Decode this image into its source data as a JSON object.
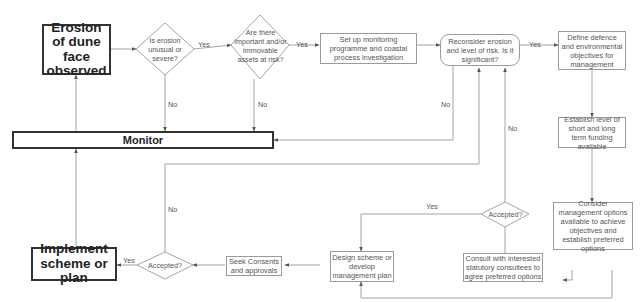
{
  "diagram": {
    "nodes": {
      "erosion_observed": "Erosion of dune face observed",
      "is_unusual": "Is erosion unusual or severe?",
      "assets_at_risk": "Are there important and/or immovable assets at risk?",
      "setup_monitoring": "Set up monitoring programme and coastal process investigation",
      "reconsider": "Reconsider erosion and level of risk. Is it significant?",
      "define_objectives": "Define defence and environmental objectives for management",
      "establish_funding": "Establish level of short and long term funding available",
      "consider_options": "Consider management options available to achieve objectives and establish preferred options",
      "consult": "Consult with interested statutory consultees to agree preferred options",
      "accepted_right": "Accepted?",
      "design_scheme": "Design scheme or develop management plan",
      "seek_consents": "Seek Consents and approvals",
      "accepted_left": "Accepted?",
      "implement": "Implement scheme or plan",
      "monitor": "Monitor"
    },
    "edge_labels": {
      "unusual_yes": "Yes",
      "unusual_no": "No",
      "assets_yes": "Yes",
      "assets_no": "No",
      "reconsider_yes": "Yes",
      "reconsider_no": "No",
      "accepted_right_yes": "Yes",
      "accepted_right_no": "No",
      "accepted_left_yes": "Yes",
      "accepted_left_no": "No"
    },
    "colors": {
      "line": "#9a9a9a",
      "bold_border": "#333333",
      "text": "#555555"
    }
  }
}
